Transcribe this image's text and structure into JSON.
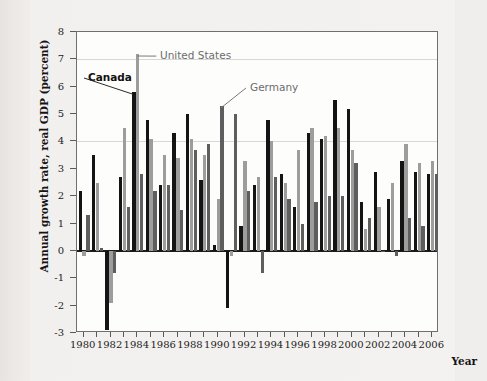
{
  "chart_data": {
    "type": "bar",
    "title": "",
    "xlabel": "Year",
    "ylabel": "Annual growth rate, real GDP (percent)",
    "ylim": [
      -3,
      8
    ],
    "ytick_labels": [
      "8",
      "7",
      "6",
      "5",
      "4",
      "3",
      "2",
      "1",
      "0",
      "-1",
      "-2",
      "-3"
    ],
    "ytick_values": [
      8,
      7,
      6,
      5,
      4,
      3,
      2,
      1,
      0,
      -1,
      -2,
      -3
    ],
    "grid": "horizontal gridlines at 7 and 4, zero baseline emphasized",
    "legend_position": "inline annotations with leader lines",
    "categories": [
      1980,
      1981,
      1982,
      1983,
      1984,
      1985,
      1986,
      1987,
      1988,
      1989,
      1990,
      1991,
      1992,
      1993,
      1994,
      1995,
      1996,
      1997,
      1998,
      1999,
      2000,
      2001,
      2002,
      2003,
      2004,
      2005,
      2006
    ],
    "xtick_labels": [
      "1980",
      "1982",
      "1984",
      "1986",
      "1988",
      "1990",
      "1992",
      "1994",
      "1996",
      "1998",
      "2000",
      "2002",
      "2004",
      "2006"
    ],
    "xtick_values": [
      1980,
      1982,
      1984,
      1986,
      1988,
      1990,
      1992,
      1994,
      1996,
      1998,
      2000,
      2002,
      2004,
      2006
    ],
    "series": [
      {
        "name": "Canada",
        "color": "#141414",
        "values": [
          2.2,
          3.5,
          -2.9,
          2.7,
          5.8,
          4.8,
          2.4,
          4.3,
          5.0,
          2.6,
          0.2,
          -2.1,
          0.9,
          2.4,
          4.8,
          2.8,
          1.6,
          4.3,
          4.1,
          5.5,
          5.2,
          1.8,
          2.9,
          1.9,
          3.3,
          2.9,
          2.8
        ]
      },
      {
        "name": "United States",
        "color": "#9d9d9d",
        "values": [
          -0.2,
          2.5,
          -1.9,
          4.5,
          7.2,
          4.1,
          3.5,
          3.4,
          4.1,
          3.5,
          1.9,
          -0.2,
          3.3,
          2.7,
          4.0,
          2.5,
          3.7,
          4.5,
          4.2,
          4.5,
          3.7,
          0.8,
          1.6,
          2.5,
          3.9,
          3.2,
          3.3
        ]
      },
      {
        "name": "Germany",
        "color": "#5e5e5e",
        "values": [
          1.3,
          0.1,
          -0.8,
          1.6,
          2.8,
          2.2,
          2.4,
          1.5,
          3.7,
          3.9,
          5.3,
          5.0,
          2.2,
          -0.8,
          2.7,
          1.9,
          1.0,
          1.8,
          2.0,
          2.0,
          3.2,
          1.2,
          0.0,
          -0.2,
          1.2,
          0.9,
          2.8
        ]
      }
    ],
    "annotations": [
      {
        "label": "Canada",
        "series": "Canada",
        "points_to_year": 1984
      },
      {
        "label": "United States",
        "series": "United States",
        "points_to_year": 1984
      },
      {
        "label": "Germany",
        "series": "Germany",
        "points_to_year": 1990
      }
    ]
  },
  "axis": {
    "y_title": "Annual growth rate, real GDP (percent)",
    "x_title": "Year"
  },
  "labels": {
    "canada": "Canada",
    "united_states": "United States",
    "germany": "Germany"
  }
}
